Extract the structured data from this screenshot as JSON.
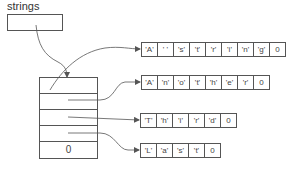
{
  "diagram": {
    "variable_label": "strings",
    "pointer_array": {
      "cells": [
        "",
        "",
        "",
        "",
        "0"
      ]
    },
    "char_arrays": [
      {
        "name": "string-0",
        "cells": [
          "'A'",
          "' '",
          "'s'",
          "'t'",
          "'r'",
          "'i'",
          "'n'",
          "'g'",
          "0"
        ]
      },
      {
        "name": "string-1",
        "cells": [
          "'A'",
          "'n'",
          "'o'",
          "'t'",
          "'h'",
          "'e'",
          "'r'",
          "0"
        ]
      },
      {
        "name": "string-2",
        "cells": [
          "'T'",
          "'h'",
          "'i'",
          "'r'",
          "'d'",
          "0"
        ]
      },
      {
        "name": "string-3",
        "cells": [
          "'L'",
          "'a'",
          "'s'",
          "'t'",
          "0"
        ]
      }
    ],
    "colors": {
      "line": "#555555",
      "text": "#444444",
      "background": "#ffffff"
    }
  }
}
